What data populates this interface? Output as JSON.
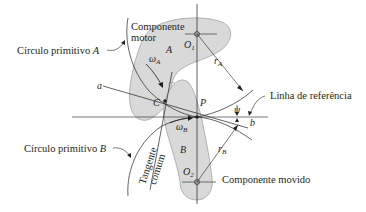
{
  "diagram": {
    "type": "cam-follower contact geometry",
    "colors": {
      "body_fill": "#d9d9da",
      "body_stroke": "#8c8c8e",
      "line": "#231f20",
      "text": "#231f20",
      "background": "#ffffff"
    },
    "labels": {
      "driver_component_line1": "Componente",
      "driver_component_line2": "motor",
      "pitch_circle_a": "Círculo primitivo A",
      "pitch_circle_a_text": "Círculo primitivo ",
      "pitch_circle_a_var": "A",
      "pitch_circle_b_text": "Círculo primitivo ",
      "pitch_circle_b_var": "B",
      "reference_line": "Linha de referência",
      "common_tangent_line1": "Tangente",
      "common_tangent_line2": "comum",
      "driven_component": "Componente movido"
    },
    "symbols": {
      "body_a": "A",
      "body_b": "B",
      "center_1": "O",
      "center_1_sub": "1",
      "center_2": "O",
      "center_2_sub": "2",
      "pitch_point": "P",
      "contact_point": "C",
      "line_start": "a",
      "line_end": "b",
      "omega_a": "ω",
      "omega_a_sub": "A",
      "omega_b": "ω",
      "omega_b_sub": "B",
      "radius_a": "r",
      "radius_a_sub": "A",
      "radius_b": "r",
      "radius_b_sub": "B",
      "pressure_angle": "ψ"
    }
  }
}
